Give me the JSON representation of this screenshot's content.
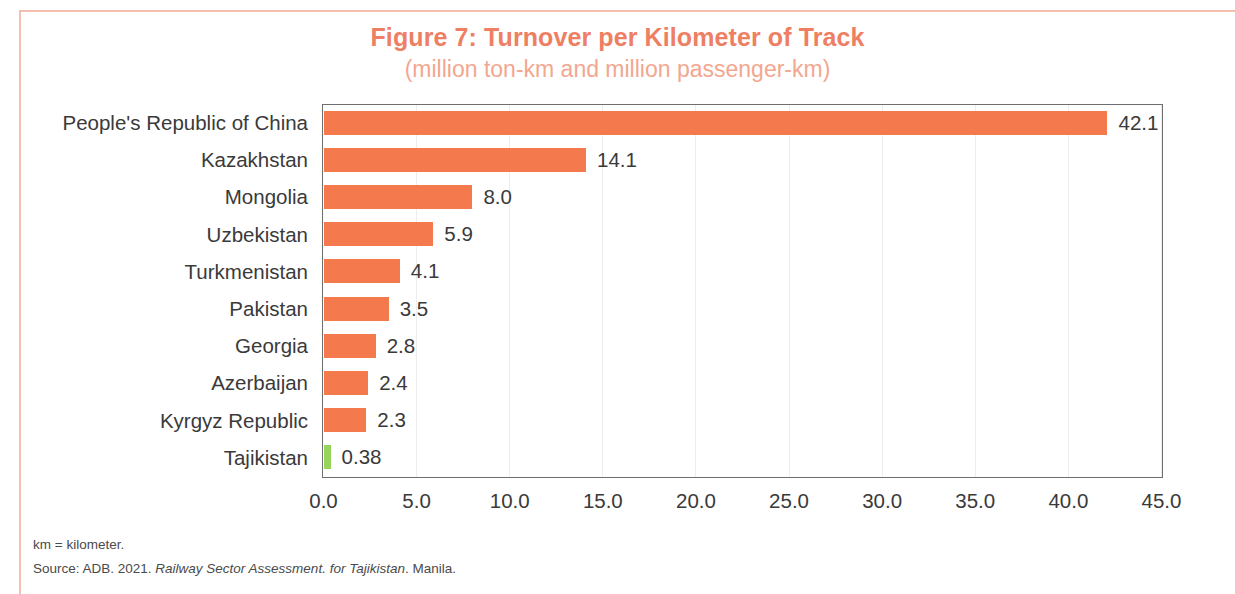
{
  "figure": {
    "title": "Figure 7: Turnover per Kilometer of Track",
    "subtitle": "(million ton-km and million passenger-km)",
    "title_color": "#EE7F63",
    "subtitle_color": "#F2A78F",
    "frame_color": "#F3BFAF"
  },
  "footnotes": {
    "abbreviation": "km = kilometer.",
    "source_prefix": "Source: ADB. 2021. ",
    "source_italic": "Railway Sector Assessment. for Tajikistan",
    "source_suffix": ". Manila."
  },
  "chart_data": {
    "type": "bar",
    "orientation": "horizontal",
    "title": "Figure 7: Turnover per Kilometer of Track",
    "subtitle": "(million ton-km and million passenger-km)",
    "xlabel": "",
    "ylabel": "",
    "xlim": [
      0.0,
      45.0
    ],
    "xticks": [
      "0.0",
      "5.0",
      "10.0",
      "15.0",
      "20.0",
      "25.0",
      "30.0",
      "35.0",
      "40.0",
      "45.0"
    ],
    "xtick_values": [
      0,
      5,
      10,
      15,
      20,
      25,
      30,
      35,
      40,
      45
    ],
    "grid": "vertical-light",
    "legend": "none",
    "bar_color": "#F4794C",
    "highlight_color": "#96D45C",
    "categories": [
      "People's Republic of China",
      "Kazakhstan",
      "Mongolia",
      "Uzbekistan",
      "Turkmenistan",
      "Pakistan",
      "Georgia",
      "Azerbaijan",
      "Kyrgyz Republic",
      "Tajikistan"
    ],
    "values": [
      42.1,
      14.1,
      8.0,
      5.9,
      4.1,
      3.5,
      2.8,
      2.4,
      2.3,
      0.38
    ],
    "value_labels": [
      "42.1",
      "14.1",
      "8.0",
      "5.9",
      "4.1",
      "3.5",
      "2.8",
      "2.4",
      "2.3",
      "0.38"
    ],
    "colors": [
      "#F4794C",
      "#F4794C",
      "#F4794C",
      "#F4794C",
      "#F4794C",
      "#F4794C",
      "#F4794C",
      "#F4794C",
      "#F4794C",
      "#96D45C"
    ]
  }
}
